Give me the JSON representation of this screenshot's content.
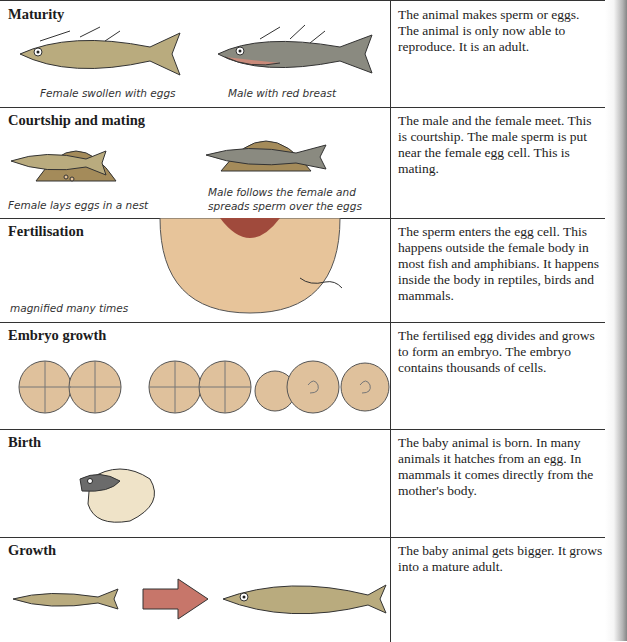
{
  "stages": [
    {
      "title": "Maturity",
      "description": "The animal makes sperm or eggs. The animal is only now able to reproduce. It is an adult.",
      "captions": [
        "Female swollen with eggs",
        "Male with red breast"
      ],
      "illustration": "two-fish-icon"
    },
    {
      "title": "Courtship and mating",
      "description": "The male and the female meet. This is courtship. The male sperm is put near the female egg cell. This is mating.",
      "captions": [
        "Female lays eggs in a nest",
        "Male follows the female and spreads sperm over the eggs"
      ],
      "illustration": "fish-in-nest-icon"
    },
    {
      "title": "Fertilisation",
      "description": "The sperm enters the egg cell. This happens outside the female body in most fish and amphibians. It happens inside the body in reptiles, birds and mammals.",
      "captions": [
        "magnified many times"
      ],
      "illustration": "egg-and-sperm-icon"
    },
    {
      "title": "Embryo growth",
      "description": "The fertilised egg divides and grows to form an embryo. The embryo contains thousands of cells.",
      "captions": [],
      "illustration": "dividing-cells-icon"
    },
    {
      "title": "Birth",
      "description": "The baby animal is born. In many animals it hatches from an egg. In mammals it comes directly from the mother's body.",
      "captions": [],
      "illustration": "hatching-fish-icon"
    },
    {
      "title": "Growth",
      "description": "The baby animal gets bigger. It grows into a mature adult.",
      "captions": [],
      "illustration": "small-fish-grows-icon"
    }
  ],
  "colors": {
    "fish_body": "#b9ab7e",
    "fish_dark": "#6b6b6b",
    "male_breast": "#c98a7a",
    "egg": "#e7c49a",
    "nucleus": "#a04a3c",
    "arrow": "#c7766a",
    "cell": "#dfc19c"
  }
}
